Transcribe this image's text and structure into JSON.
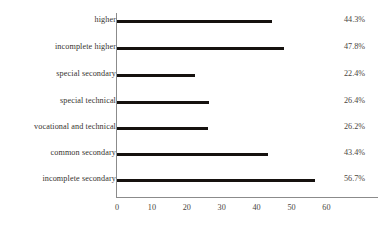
{
  "chart_data": {
    "type": "bar",
    "orientation": "horizontal",
    "title": "",
    "subtitle": "",
    "xlabel": "",
    "ylabel": "",
    "grid": false,
    "legend": null,
    "xlim": [
      0,
      75
    ],
    "xticks": [
      0,
      10,
      20,
      30,
      40,
      50,
      60
    ],
    "xtick_labels": [
      "0",
      "10",
      "20",
      "30",
      "40",
      "50",
      "60"
    ],
    "categories": [
      "higher",
      "incomplete higher",
      "special secondary",
      "special technical",
      "vocational and technical",
      "common secondary",
      "incomplete secondary"
    ],
    "values": [
      44.3,
      47.8,
      22.4,
      26.4,
      26.2,
      43.4,
      56.7
    ],
    "value_labels": [
      "44.3%",
      "47.8%",
      "22.4%",
      "26.4%",
      "26.2%",
      "43.4%",
      "56.7%"
    ],
    "colors": {
      "bar": "#16120f",
      "axis": "#8b8b8b",
      "text": "#3a3a3a",
      "background": "#ffffff"
    }
  }
}
